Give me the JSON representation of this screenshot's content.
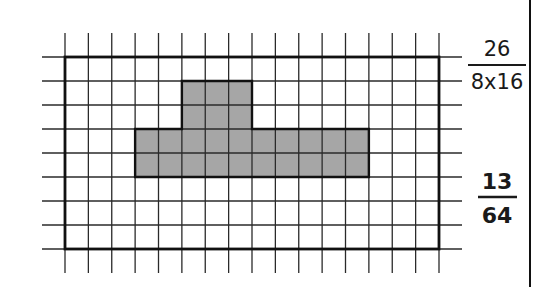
{
  "diagram": {
    "type": "grid-area-model",
    "grid": {
      "rows": 8,
      "columns": 16,
      "origin_x": 65,
      "origin_y": 57,
      "cell_w": 23.375,
      "cell_h": 24,
      "extend_lines_x": 23,
      "extend_lines_y": 24,
      "line_color": "#2a2a2a",
      "border_color": "#111111",
      "shade_color": "#a6a6a6"
    },
    "shaded_regions": [
      {
        "name": "top-block",
        "col_start": 5,
        "col_end": 8,
        "row_start": 1,
        "row_end": 3
      },
      {
        "name": "bottom-band",
        "col_start": 3,
        "col_end": 13,
        "row_start": 3,
        "row_end": 5
      }
    ],
    "shaded_cell_count": 26,
    "total_cell_count": 128
  },
  "labels": {
    "fraction_1": {
      "numerator": "26",
      "denominator": "8x16",
      "bold": false
    },
    "fraction_2": {
      "numerator": "13",
      "denominator": "64",
      "bold": true
    }
  },
  "divider": {
    "x": 530,
    "color": "#111111"
  }
}
